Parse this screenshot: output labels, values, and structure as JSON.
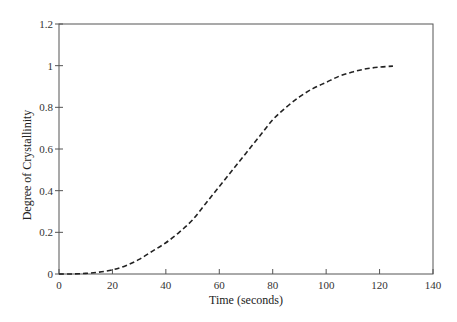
{
  "chart_data": {
    "type": "line",
    "title": "",
    "xlabel": "Time (seconds)",
    "ylabel": "Degree of Crystallinity",
    "xlim": [
      0,
      140
    ],
    "ylim": [
      0,
      1.2
    ],
    "xticks": [
      0,
      20,
      40,
      60,
      80,
      100,
      120,
      140
    ],
    "yticks": [
      0,
      0.2,
      0.4,
      0.6,
      0.8,
      1,
      1.2
    ],
    "xtick_labels": [
      "0",
      "20",
      "40",
      "60",
      "80",
      "100",
      "120",
      "140"
    ],
    "ytick_labels": [
      "0",
      "0.2",
      "0.4",
      "0.6",
      "0.8",
      "1",
      "1.2"
    ],
    "grid": false,
    "legend": null,
    "series": [
      {
        "name": "Degree of Crystallinity",
        "style": "dashed",
        "color": "#222222",
        "x": [
          0,
          5,
          10,
          15,
          20,
          25,
          30,
          35,
          40,
          45,
          50,
          55,
          60,
          65,
          70,
          75,
          80,
          85,
          90,
          95,
          100,
          105,
          110,
          115,
          120,
          125
        ],
        "y": [
          0,
          0.0003,
          0.003,
          0.009,
          0.02,
          0.04,
          0.07,
          0.11,
          0.15,
          0.2,
          0.26,
          0.34,
          0.42,
          0.5,
          0.58,
          0.66,
          0.74,
          0.8,
          0.85,
          0.89,
          0.92,
          0.95,
          0.97,
          0.985,
          0.993,
          0.998
        ]
      }
    ]
  }
}
